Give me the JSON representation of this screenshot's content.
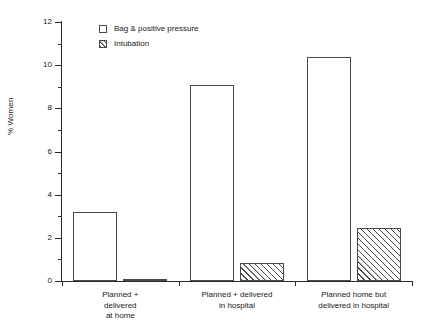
{
  "chart_data": {
    "type": "bar",
    "title": "",
    "xlabel": "",
    "ylabel": "% Women",
    "ylim": [
      0,
      12
    ],
    "ytick_step": 2,
    "yminor_step": 1,
    "grid": false,
    "legend_position": "top-left-inside",
    "ytick_labels": [
      "0",
      "2",
      "4",
      "6",
      "8",
      "10",
      "12"
    ],
    "categories": [
      "Planned +\ndelivered\nat home",
      "Planned + delivered\nin hospital",
      "Planned home but\ndelivered in hospital"
    ],
    "series": [
      {
        "name": "Bag & positive pressure",
        "style": "open",
        "values": [
          3.2,
          9.1,
          10.4
        ]
      },
      {
        "name": "Intubation",
        "style": "hatched",
        "values": [
          0.1,
          0.85,
          2.45
        ]
      }
    ]
  },
  "legend": {
    "items": [
      {
        "label": "Bag & positive pressure",
        "swatch": "open-square-icon"
      },
      {
        "label": "Intubation",
        "swatch": "hatched-square-icon"
      }
    ]
  },
  "axes": {
    "y_title": "% Women"
  }
}
